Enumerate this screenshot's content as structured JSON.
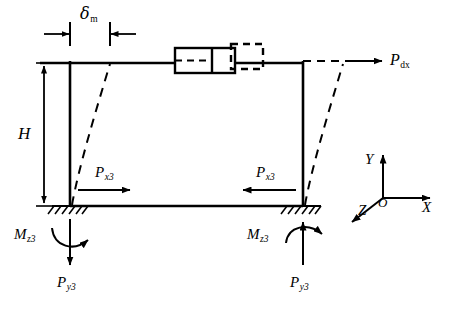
{
  "diagram": {
    "stroke_color": "#000000",
    "background_color": "#ffffff",
    "labels": {
      "delta_m": "δ",
      "delta_m_sub": "m",
      "height": "H",
      "force_dx": "P",
      "force_dx_sub": "dx",
      "force_x3_left": "P",
      "force_x3_left_sub": "x3",
      "force_x3_right": "P",
      "force_x3_right_sub": "x3",
      "moment_z3_left": "M",
      "moment_z3_left_sub": "z3",
      "moment_z3_right": "M",
      "moment_z3_right_sub": "z3",
      "force_y3_left": "P",
      "force_y3_left_sub": "y3",
      "force_y3_right": "P",
      "force_y3_right_sub": "y3"
    },
    "axes": {
      "x_label": "X",
      "y_label": "Y",
      "z_label": "Z",
      "origin_label": "O"
    }
  }
}
